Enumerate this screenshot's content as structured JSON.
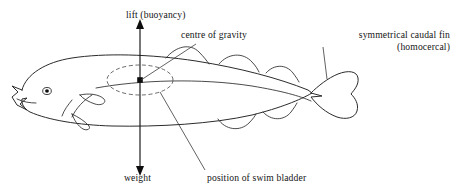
{
  "diagram": {
    "background_color": "#ffffff",
    "ink_color": "#2b2b2b",
    "label_color": "#141414",
    "bladder_stroke_color": "#5a5a5a"
  },
  "labels": {
    "lift": "lift (buoyancy)",
    "centre_of_gravity": "centre of gravity",
    "caudal_fin_line1": "symmetrical caudal fin",
    "caudal_fin_line2": "(homocercal)",
    "weight": "weight",
    "swim_bladder": "position of swim bladder"
  },
  "annotations": {
    "force_arrow": {
      "name": "vertical-force-arrow",
      "type": "double-headed-arrow",
      "orientation": "vertical",
      "upper_label": "lift (buoyancy)",
      "lower_label": "weight",
      "x": 140,
      "y_top": 22,
      "y_bottom": 173
    },
    "centre_of_gravity_marker": {
      "name": "centre-of-gravity-dot",
      "x": 140,
      "y": 80,
      "shape": "filled-square-dot"
    },
    "swim_bladder_shape": {
      "name": "swim-bladder-ellipse",
      "style": "dashed-ellipse",
      "cx": 140,
      "cy": 80,
      "rx": 33,
      "ry": 15
    }
  },
  "icons": {
    "arrow_up": "arrow-up-icon",
    "arrow_down": "arrow-down-icon",
    "eye": "fish-eye-icon"
  },
  "anatomy_parts": [
    {
      "name": "body-outline",
      "label": "body"
    },
    {
      "name": "fish-eye",
      "label": "eye"
    },
    {
      "name": "fish-mouth",
      "label": "mouth"
    },
    {
      "name": "operculum",
      "label": "gill cover"
    },
    {
      "name": "pectoral-fin",
      "label": "pectoral fin"
    },
    {
      "name": "pelvic-fin",
      "label": "pelvic fin"
    },
    {
      "name": "dorsal-fin-first",
      "label": "first dorsal fin"
    },
    {
      "name": "dorsal-fin-second",
      "label": "second dorsal fin"
    },
    {
      "name": "dorsal-fin-third",
      "label": "third dorsal fin"
    },
    {
      "name": "anal-fin-first",
      "label": "first anal fin"
    },
    {
      "name": "anal-fin-second",
      "label": "second anal fin"
    },
    {
      "name": "caudal-fin",
      "label": "caudal fin"
    },
    {
      "name": "lateral-line",
      "label": "lateral line"
    },
    {
      "name": "swim-bladder",
      "label": "swim bladder"
    }
  ]
}
